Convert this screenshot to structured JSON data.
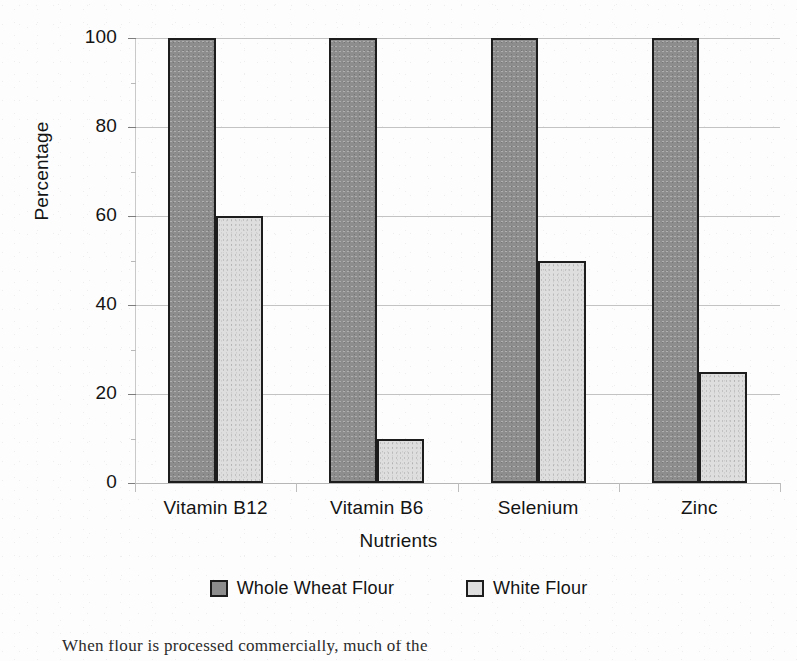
{
  "chart_data": {
    "type": "bar",
    "title": "",
    "xlabel": "Nutrients",
    "ylabel": "Percentage",
    "categories": [
      "Vitamin B12",
      "Vitamin B6",
      "Selenium",
      "Zinc"
    ],
    "series": [
      {
        "name": "Whole Wheat Flour",
        "color": "#8d8d8d",
        "values": [
          100,
          100,
          100,
          100
        ]
      },
      {
        "name": "White Flour",
        "color": "#dedede",
        "values": [
          60,
          10,
          50,
          25
        ]
      }
    ],
    "ylim": [
      0,
      100
    ],
    "ytick_labels": [
      "0",
      "20",
      "40",
      "60",
      "80",
      "100"
    ],
    "ytick_values": [
      0,
      20,
      40,
      60,
      80,
      100
    ],
    "yminor_values": [
      10,
      30,
      50,
      70,
      90
    ],
    "grid": "horizontal",
    "legend_position": "bottom"
  },
  "axes": {
    "y_title": "Percentage",
    "x_title": "Nutrients"
  },
  "legend": {
    "entries": [
      {
        "label": "Whole Wheat Flour",
        "swatch": "legend-swatch-whole-wheat-flour"
      },
      {
        "label": "White Flour",
        "swatch": "legend-swatch-white-flour"
      }
    ]
  },
  "caption": {
    "partial_line": "When flour is processed commercially, much of the"
  }
}
